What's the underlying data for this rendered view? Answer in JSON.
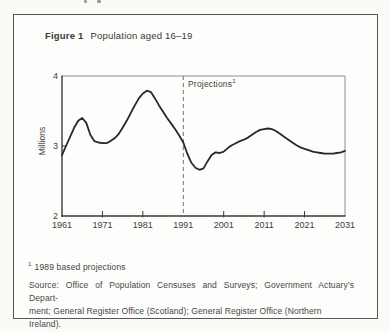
{
  "figure": {
    "title_label": "Figure 1",
    "title_text": "Population aged 16–19",
    "footnote_marker": "1",
    "footnote_text": "1989 based projections",
    "source_lines": [
      "Source: Office of Population Censuses and Surveys; Government Actuary’s Depart-",
      "ment; General Register Office (Scotland); General Register Office (Northern Ireland)."
    ]
  },
  "chart_data": {
    "type": "line",
    "title": "Population aged 16–19",
    "xlabel": "",
    "ylabel": "Millions",
    "xlim": [
      1961,
      2031
    ],
    "ylim": [
      2,
      4
    ],
    "xticks": [
      1961,
      1971,
      1981,
      1991,
      2001,
      2011,
      2021,
      2031
    ],
    "yticks": [
      4,
      3,
      2
    ],
    "grid": false,
    "legend": "none",
    "annotation": {
      "label": "Projections",
      "superscript": "1",
      "at_year": 1991
    },
    "projection_divider_year": 1991,
    "line_color": "#282828",
    "series": [
      {
        "name": "Population aged 16–19 (millions)",
        "x": [
          1961,
          1962,
          1963,
          1964,
          1965,
          1966,
          1967,
          1968,
          1969,
          1970,
          1971,
          1972,
          1973,
          1974,
          1975,
          1976,
          1977,
          1978,
          1979,
          1980,
          1981,
          1982,
          1983,
          1984,
          1985,
          1986,
          1987,
          1988,
          1989,
          1990,
          1991,
          1992,
          1993,
          1994,
          1995,
          1996,
          1997,
          1998,
          1999,
          2000,
          2001,
          2002,
          2003,
          2004,
          2005,
          2006,
          2007,
          2008,
          2009,
          2010,
          2011,
          2012,
          2013,
          2014,
          2015,
          2016,
          2017,
          2018,
          2019,
          2020,
          2021,
          2022,
          2023,
          2024,
          2025,
          2026,
          2027,
          2028,
          2029,
          2030,
          2031
        ],
        "y": [
          2.87,
          3.0,
          3.13,
          3.26,
          3.36,
          3.4,
          3.33,
          3.16,
          3.07,
          3.05,
          3.04,
          3.04,
          3.07,
          3.11,
          3.17,
          3.26,
          3.36,
          3.47,
          3.58,
          3.68,
          3.75,
          3.79,
          3.77,
          3.68,
          3.58,
          3.49,
          3.4,
          3.32,
          3.24,
          3.15,
          3.05,
          2.89,
          2.76,
          2.69,
          2.66,
          2.68,
          2.78,
          2.87,
          2.91,
          2.9,
          2.92,
          2.97,
          3.01,
          3.04,
          3.07,
          3.09,
          3.12,
          3.16,
          3.2,
          3.23,
          3.24,
          3.25,
          3.24,
          3.21,
          3.17,
          3.13,
          3.09,
          3.05,
          3.01,
          2.98,
          2.96,
          2.94,
          2.92,
          2.91,
          2.9,
          2.89,
          2.89,
          2.89,
          2.9,
          2.91,
          2.93
        ]
      }
    ]
  }
}
